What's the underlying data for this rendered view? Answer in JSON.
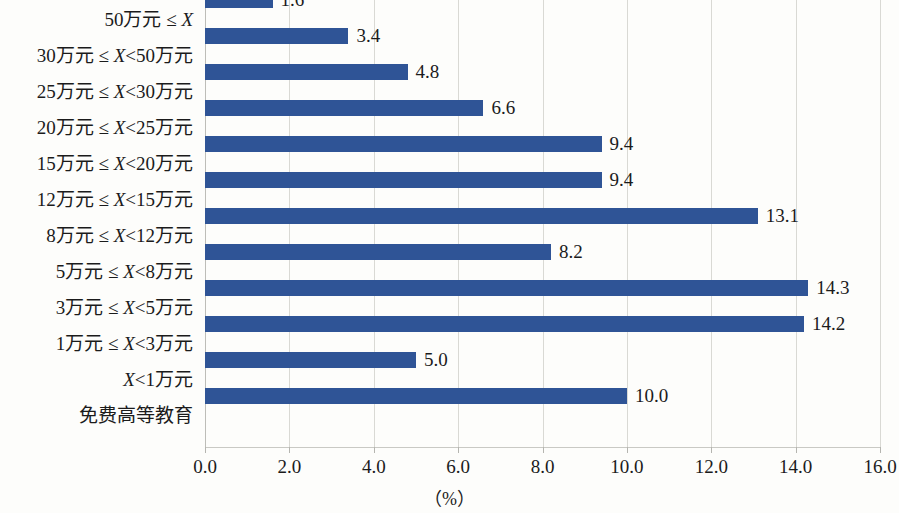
{
  "chart_data": {
    "type": "bar",
    "orientation": "horizontal",
    "title": "",
    "subtitle": "",
    "xlabel": "（%）",
    "ylabel": "",
    "xlim": [
      0.0,
      16.0
    ],
    "xticks": [
      "0.0",
      "2.0",
      "4.0",
      "6.0",
      "8.0",
      "10.0",
      "12.0",
      "14.0",
      "16.0"
    ],
    "xtick_values": [
      0,
      2,
      4,
      6,
      8,
      10,
      12,
      14,
      16
    ],
    "grid": true,
    "legend": "none",
    "bar_color": "#2f5496",
    "categories": [
      "50万元 ≤ X",
      "30万元 ≤ X<50万元",
      "25万元 ≤ X<30万元",
      "20万元 ≤ X<25万元",
      "15万元 ≤ X<20万元",
      "12万元 ≤ X<15万元",
      "8万元 ≤ X<12万元",
      "5万元 ≤ X<8万元",
      "3万元 ≤ X<5万元",
      "1万元 ≤ X<3万元",
      "X<1万元",
      "免费高等教育"
    ],
    "values": [
      1.6,
      3.4,
      4.8,
      6.6,
      9.4,
      9.4,
      13.1,
      8.2,
      14.3,
      14.2,
      5.0,
      10.0
    ],
    "data_labels": [
      "1.6",
      "3.4",
      "4.8",
      "6.6",
      "9.4",
      "9.4",
      "13.1",
      "8.2",
      "14.3",
      "14.2",
      "5.0",
      "10.0"
    ]
  },
  "category_parts": [
    {
      "pre": "50万元 ≤ ",
      "var": "X",
      "post": ""
    },
    {
      "pre": "30万元 ≤ ",
      "var": "X",
      "post": "<50万元"
    },
    {
      "pre": "25万元 ≤ ",
      "var": "X",
      "post": "<30万元"
    },
    {
      "pre": "20万元 ≤ ",
      "var": "X",
      "post": "<25万元"
    },
    {
      "pre": "15万元 ≤ ",
      "var": "X",
      "post": "<20万元"
    },
    {
      "pre": "12万元 ≤ ",
      "var": "X",
      "post": "<15万元"
    },
    {
      "pre": "8万元 ≤ ",
      "var": "X",
      "post": "<12万元"
    },
    {
      "pre": "5万元 ≤ ",
      "var": "X",
      "post": "<8万元"
    },
    {
      "pre": "3万元 ≤ ",
      "var": "X",
      "post": "<5万元"
    },
    {
      "pre": "1万元 ≤ ",
      "var": "X",
      "post": "<3万元"
    },
    {
      "pre": "",
      "var": "X",
      "post": "<1万元"
    },
    {
      "pre": "免费高等教育",
      "var": "",
      "post": ""
    }
  ],
  "colors": {
    "bar": "#2f5496",
    "gridline": "#d9d9d4",
    "axis": "#bdbdb8",
    "text": "#1b1b1b",
    "background": "#fdfdfb"
  }
}
